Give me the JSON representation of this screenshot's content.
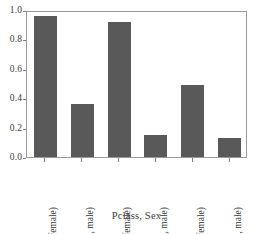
{
  "chart_data": {
    "type": "bar",
    "title": "",
    "subtitle": "",
    "xlabel": "Pclass, Sex",
    "ylabel": "",
    "categories": [
      "(1, female)",
      "(1, male)",
      "(2, female)",
      "(2, male)",
      "(3, female)",
      "(3, male)"
    ],
    "values": [
      0.96,
      0.36,
      0.92,
      0.15,
      0.49,
      0.13
    ],
    "ylim": [
      0.0,
      1.0
    ],
    "yticks": [
      "1.0",
      "0.8",
      "0.6",
      "0.4",
      "0.2",
      "0.0"
    ],
    "ytick_values": [
      1.0,
      0.8,
      0.6,
      0.4,
      0.2,
      0.0
    ],
    "grid": false,
    "legend": null,
    "bar_color": "#595959",
    "frame_color": "#9a9a9a",
    "background_color": "#ffffff"
  }
}
